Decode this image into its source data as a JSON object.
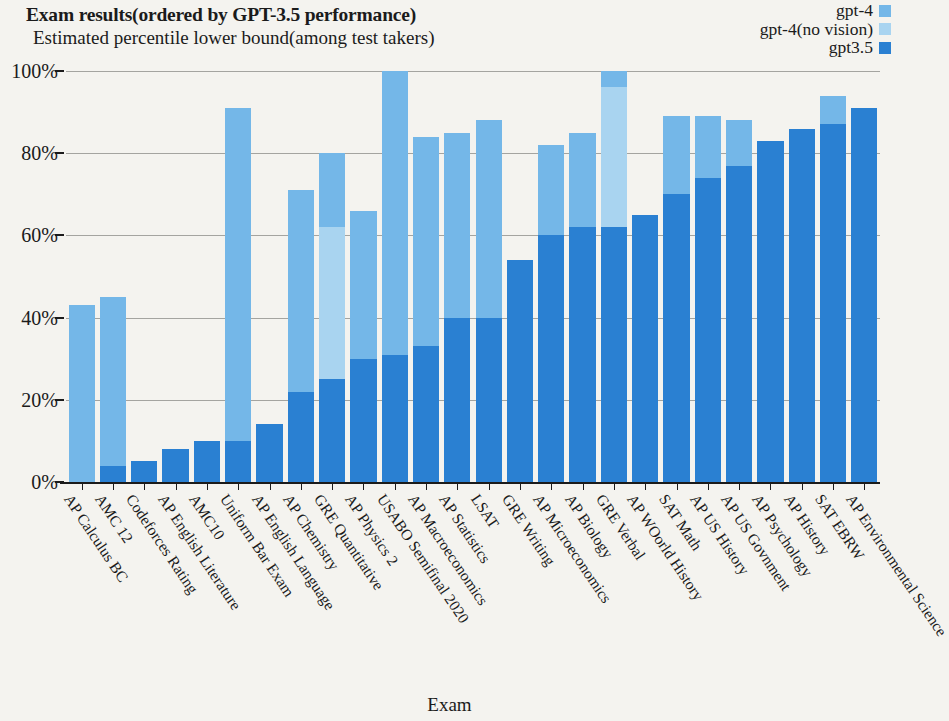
{
  "header": {
    "title": "Exam results(ordered by GPT-3.5 performance)",
    "subtitle": "Estimated percentile lower bound(among test takers)"
  },
  "legend": {
    "position": "top-right",
    "entries": [
      {
        "label": "gpt-4",
        "color": "#74b7e8",
        "swatch_name": "legend-swatch-gpt-4"
      },
      {
        "label": "gpt-4(no vision)",
        "color": "#a9d4f0",
        "swatch_name": "legend-swatch-gpt-4-no-vision"
      },
      {
        "label": "gpt3.5",
        "color": "#2a80d2",
        "swatch_name": "legend-swatch-gpt35"
      }
    ]
  },
  "axes": {
    "x_title": "Exam",
    "y_ticks": [
      "0%",
      "20%",
      "40%",
      "60%",
      "80%",
      "100%"
    ],
    "y_tick_values": [
      0,
      20,
      40,
      60,
      80,
      100
    ],
    "ylim": [
      0,
      100
    ],
    "grid": true
  },
  "chart_data": {
    "type": "bar",
    "bar_mode": "overlay-stacked",
    "title": "Exam results(ordered by GPT-3.5 performance)",
    "subtitle": "Estimated percentile lower bound(among test takers)",
    "xlabel": "Exam",
    "ylabel": "Estimated percentile lower bound(among test takers)",
    "ylim": [
      0,
      100
    ],
    "yticks": [
      0,
      20,
      40,
      60,
      80,
      100
    ],
    "ytick_labels": [
      "0%",
      "20%",
      "40%",
      "60%",
      "80%",
      "100%"
    ],
    "grid": true,
    "legend_position": "top-right",
    "categories": [
      "AP Calculus BC",
      "AMC 12",
      "Codeforces Rating",
      "AP English Literature",
      "AMC10",
      "Uniform Bar Exam",
      "AP English Language",
      "AP Chemistry",
      "GRE Quantitative",
      "AP Physics 2",
      "USABO Semifinal 2020",
      "AP Macroeconomics",
      "AP Statistics",
      "LSAT",
      "GRE Writing",
      "AP Microeconomics",
      "AP Biology",
      "GRE Verbal",
      "AP WOorld  History",
      "SAT Math",
      "AP US History",
      "AP US Govnment",
      "AP Psychology",
      "AP History",
      "SAT EBRW",
      "AP Environmental Science"
    ],
    "series": [
      {
        "name": "gpt-4",
        "color": "#74b7e8",
        "values": [
          43,
          45,
          5,
          8,
          10,
          91,
          14,
          71,
          80,
          66,
          100,
          84,
          85,
          88,
          54,
          82,
          85,
          100,
          65,
          89,
          89,
          88,
          83,
          86,
          94,
          91
        ]
      },
      {
        "name": "gpt-4(no vision)",
        "color": "#a9d4f0",
        "values": [
          43,
          45,
          5,
          8,
          10,
          91,
          14,
          71,
          62,
          66,
          100,
          84,
          85,
          88,
          54,
          82,
          85,
          96,
          65,
          89,
          89,
          88,
          83,
          86,
          87,
          91
        ]
      },
      {
        "name": "gpt3.5",
        "color": "#2a80d2",
        "values": [
          0,
          4,
          5,
          8,
          10,
          10,
          14,
          22,
          25,
          30,
          31,
          33,
          40,
          40,
          54,
          60,
          62,
          62,
          65,
          70,
          74,
          77,
          83,
          86,
          87,
          91
        ]
      }
    ]
  }
}
